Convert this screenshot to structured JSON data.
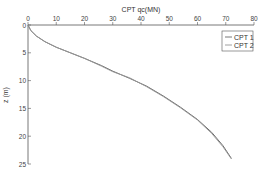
{
  "chart_data": {
    "type": "line",
    "title": "CPT qc(MN)",
    "xlabel": "CPT qc(MN)",
    "ylabel": "z (m)",
    "xlim": [
      0,
      80
    ],
    "ylim": [
      25,
      0
    ],
    "x_axis_position": "top",
    "y_axis_inverted": true,
    "grid": false,
    "legend_position": "upper right",
    "xticks": [
      0,
      10,
      20,
      30,
      40,
      50,
      60,
      70,
      80
    ],
    "yticks": [
      0,
      5,
      10,
      15,
      20,
      25
    ],
    "series": [
      {
        "name": "CPT 1",
        "points": [
          [
            0,
            0
          ],
          [
            1,
            1
          ],
          [
            3,
            2
          ],
          [
            6,
            3
          ],
          [
            10,
            4
          ],
          [
            15,
            5
          ],
          [
            20,
            6
          ],
          [
            26,
            7.3
          ],
          [
            30,
            8.3
          ],
          [
            36,
            9.6
          ],
          [
            42,
            11
          ],
          [
            48,
            12.8
          ],
          [
            54,
            14.8
          ],
          [
            60,
            17
          ],
          [
            65,
            19.3
          ],
          [
            69,
            21.7
          ],
          [
            72,
            24
          ]
        ]
      },
      {
        "name": "CPT 2",
        "points": [
          [
            0,
            0
          ],
          [
            1,
            1
          ],
          [
            3,
            2
          ],
          [
            6,
            3
          ],
          [
            10,
            4
          ],
          [
            15,
            5
          ],
          [
            20,
            6
          ],
          [
            26,
            7.4
          ],
          [
            30,
            8.4
          ],
          [
            36,
            9.5
          ],
          [
            42,
            11.1
          ],
          [
            48,
            12.9
          ],
          [
            54,
            14.9
          ],
          [
            60,
            17.1
          ],
          [
            65,
            19.5
          ],
          [
            69,
            21.9
          ],
          [
            72,
            24.1
          ]
        ]
      }
    ]
  },
  "labels": {
    "title": "CPT qc(MN)",
    "ylabel": "z (m)",
    "xticks": [
      "0",
      "10",
      "20",
      "30",
      "40",
      "50",
      "60",
      "70",
      "80"
    ],
    "yticks": [
      "0",
      "5",
      "10",
      "15",
      "20",
      "25"
    ],
    "legend": [
      "CPT 1",
      "CPT 2"
    ]
  }
}
